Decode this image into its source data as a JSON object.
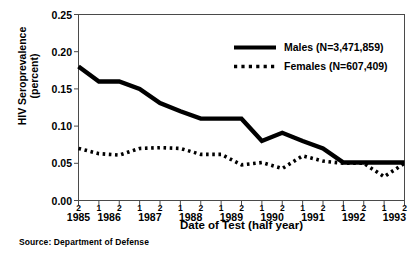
{
  "figure": {
    "source_note": "Source:  Department of Defense"
  },
  "axes": {
    "y": {
      "label_line1": "HIV Seroprevalence",
      "label_line2": "(percent)",
      "ticks": [
        "0.00",
        "0.05",
        "0.10",
        "0.15",
        "0.20",
        "0.25"
      ]
    },
    "x": {
      "label": "Date of Test (half year)",
      "years": [
        "1985",
        "1986",
        "1987",
        "1988",
        "1989",
        "1990",
        "1991",
        "1992",
        "1993"
      ],
      "halves": [
        "2",
        "1",
        "2",
        "1",
        "2",
        "1",
        "2",
        "1",
        "2",
        "1",
        "2",
        "1",
        "2",
        "1",
        "2",
        "1",
        "2"
      ]
    }
  },
  "legend": {
    "entries": [
      {
        "name": "males",
        "label": "Males (N=3,471,859)",
        "style": "solid",
        "color": "#000000"
      },
      {
        "name": "females",
        "label": "Females (N=607,409)",
        "style": "dotted",
        "color": "#000000"
      }
    ]
  },
  "chart_data": {
    "type": "line",
    "title": "",
    "xlabel": "Date of Test (half year)",
    "ylabel": "HIV Seroprevalence (percent)",
    "ylim": [
      0.0,
      0.25
    ],
    "ytick_values": [
      0.0,
      0.05,
      0.1,
      0.15,
      0.2,
      0.25
    ],
    "grid": false,
    "legend_position": "top-right",
    "categories": [
      "1985-2",
      "1986-1",
      "1986-2",
      "1987-1",
      "1987-2",
      "1988-1",
      "1988-2",
      "1989-1",
      "1989-2",
      "1990-1",
      "1990-2",
      "1991-1",
      "1991-2",
      "1992-1",
      "1992-2",
      "1993-1",
      "1993-2"
    ],
    "series": [
      {
        "name": "Males (N=3,471,859)",
        "style": "solid",
        "color": "#000000",
        "values": [
          0.18,
          0.16,
          0.16,
          0.15,
          0.131,
          0.12,
          0.11,
          0.11,
          0.11,
          0.08,
          0.091,
          0.08,
          0.07,
          0.051,
          0.051,
          0.051,
          0.051
        ]
      },
      {
        "name": "Females (N=607,409)",
        "style": "dotted",
        "color": "#000000",
        "values": [
          0.07,
          0.063,
          0.061,
          0.07,
          0.071,
          0.07,
          0.062,
          0.062,
          0.048,
          0.051,
          0.043,
          0.06,
          0.053,
          0.05,
          0.05,
          0.032,
          0.05
        ]
      }
    ]
  }
}
